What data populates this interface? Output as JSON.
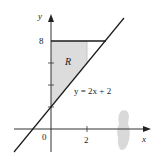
{
  "diagram": {
    "axes": {
      "x_label": "x",
      "y_label": "y",
      "origin_label": "0",
      "x_ticks": [
        {
          "value": 2,
          "label": "2"
        }
      ],
      "y_ticks": [
        {
          "value": 8,
          "label": "8"
        },
        {
          "value": 6,
          "label": ""
        },
        {
          "value": 4,
          "label": ""
        },
        {
          "value": 2,
          "label": ""
        }
      ]
    },
    "region_label": "R",
    "line_equation": "y = 2x + 2",
    "horizontal_line": "y = 8",
    "vertical_bound": "x = 2",
    "colors": {
      "region_fill": "#dcdcdc",
      "line": "#1a1a1a",
      "axis": "#333333",
      "artifact": "#c8c8c8"
    }
  }
}
